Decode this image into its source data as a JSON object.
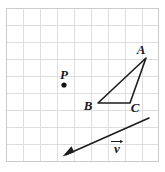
{
  "figure": {
    "background_color": "#ffffff",
    "grid": {
      "line_color": "#dcdcdc",
      "border_color": "#cfcfcf",
      "cell_size": 17,
      "columns": 9,
      "rows": 9,
      "origin_x": 6,
      "origin_y": 8
    },
    "stroke_color": "#1d1d1d",
    "labels": {
      "vertex_a": "A",
      "vertex_b": "B",
      "vertex_c": "C",
      "point_p": "P",
      "vector_v": "v"
    },
    "geometry": {
      "triangle": {
        "name": "triangle-abc",
        "points": "146,58 98,103 130,103",
        "a": {
          "x": 146,
          "y": 58
        },
        "b": {
          "x": 98,
          "y": 103
        },
        "c": {
          "x": 130,
          "y": 103
        }
      },
      "point_p": {
        "x": 64,
        "y": 85,
        "radius": 2.6
      },
      "vector_v": {
        "tail": {
          "x": 149,
          "y": 118
        },
        "head": {
          "x": 63,
          "y": 156
        }
      }
    },
    "label_positions": {
      "a": {
        "x": 141,
        "y": 54
      },
      "b": {
        "x": 88,
        "y": 110
      },
      "c": {
        "x": 133,
        "y": 111
      },
      "p": {
        "x": 60,
        "y": 79
      },
      "v": {
        "x": 116,
        "y": 152
      }
    }
  }
}
